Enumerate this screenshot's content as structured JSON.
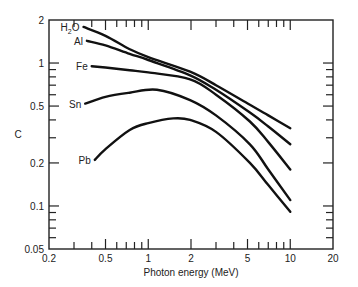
{
  "chart_data": {
    "type": "line",
    "title": "",
    "xlabel": "Photon energy (MeV)",
    "ylabel": "C",
    "xscale": "log",
    "yscale": "log",
    "xlim": [
      0.2,
      20
    ],
    "ylim": [
      0.05,
      2
    ],
    "grid": false,
    "legend": "inline labels at left end of each curve",
    "x_ticks": [
      0.2,
      0.5,
      1,
      2,
      5,
      10,
      20
    ],
    "x_tick_labels": [
      "0.2",
      "0.5",
      "1",
      "2",
      "5",
      "10",
      "20"
    ],
    "y_ticks": [
      0.05,
      0.1,
      0.2,
      0.5,
      1,
      2
    ],
    "y_tick_labels": [
      "0.05",
      "0.1",
      "0.2",
      "0.5",
      "1",
      "2"
    ],
    "series": [
      {
        "name": "H2O",
        "label_main": "H",
        "label_sub": "2",
        "label_tail": "O",
        "x": [
          0.35,
          0.5,
          0.74,
          1.0,
          1.97,
          3.0,
          5.2,
          7.0,
          10.0
        ],
        "values": [
          1.79,
          1.55,
          1.25,
          1.1,
          0.87,
          0.7,
          0.51,
          0.43,
          0.35
        ]
      },
      {
        "name": "Al",
        "label_main": "Al",
        "label_sub": "",
        "label_tail": "",
        "x": [
          0.37,
          0.5,
          0.74,
          1.0,
          1.97,
          3.0,
          5.2,
          7.0,
          10.0
        ],
        "values": [
          1.43,
          1.33,
          1.16,
          1.05,
          0.82,
          0.65,
          0.45,
          0.36,
          0.27
        ]
      },
      {
        "name": "Fe",
        "label_main": "Fe",
        "label_sub": "",
        "label_tail": "",
        "x": [
          0.4,
          0.5,
          0.74,
          1.0,
          1.97,
          3.0,
          5.2,
          7.0,
          10.0
        ],
        "values": [
          0.95,
          0.93,
          0.89,
          0.86,
          0.77,
          0.6,
          0.39,
          0.28,
          0.18
        ]
      },
      {
        "name": "Sn",
        "label_main": "Sn",
        "label_sub": "",
        "label_tail": "",
        "x": [
          0.36,
          0.5,
          0.74,
          1.15,
          1.97,
          3.0,
          5.2,
          7.0,
          10.0
        ],
        "values": [
          0.52,
          0.58,
          0.62,
          0.65,
          0.55,
          0.43,
          0.27,
          0.18,
          0.11
        ]
      },
      {
        "name": "Pb",
        "label_main": "Pb",
        "label_sub": "",
        "label_tail": "",
        "x": [
          0.42,
          0.5,
          0.74,
          1.0,
          1.5,
          1.97,
          3.0,
          5.2,
          7.0,
          10.0
        ],
        "values": [
          0.21,
          0.25,
          0.34,
          0.38,
          0.41,
          0.4,
          0.33,
          0.2,
          0.14,
          0.091
        ]
      }
    ],
    "series_colors": {
      "line": "#111111"
    }
  }
}
